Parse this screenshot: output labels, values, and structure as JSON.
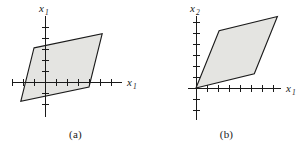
{
  "figure": {
    "background_color": "#ffffff",
    "axis_color": "#1a1a1a",
    "shape_fill_color": "#e4e4e1",
    "shape_stroke_color": "#1a1a1a"
  },
  "panels": [
    {
      "id": "a",
      "caption": "(a)",
      "y_axis_label": "x",
      "y_axis_subscript": "1",
      "x_axis_label": "x",
      "x_axis_subscript": "1",
      "origin_px": {
        "x": 45,
        "y": 82
      },
      "unit_px": 11,
      "x_axis_extent_px": {
        "left": -33,
        "right": 77
      },
      "y_axis_extent_px": {
        "up": -66,
        "down": 35
      },
      "x_ticks_units": [
        -3,
        -2,
        -1,
        1,
        2,
        3,
        4,
        5,
        6
      ],
      "y_ticks_units": [
        -2,
        -1,
        1,
        2,
        3,
        4,
        5
      ],
      "parallelogram_units": [
        {
          "x": -1.0,
          "y": 3.1
        },
        {
          "x": 5.2,
          "y": 4.4
        },
        {
          "x": 4.0,
          "y": -0.45
        },
        {
          "x": -2.2,
          "y": -1.75
        }
      ]
    },
    {
      "id": "b",
      "caption": "(b)",
      "y_axis_label": "x",
      "y_axis_subscript": "2",
      "x_axis_label": "x",
      "x_axis_subscript": "1",
      "origin_px": {
        "x": 45,
        "y": 88
      },
      "unit_px": 11,
      "x_axis_extent_px": {
        "left": -8,
        "right": 85
      },
      "y_axis_extent_px": {
        "up": -72,
        "down": 32
      },
      "x_ticks_units": [
        1,
        2,
        3,
        4,
        5,
        6,
        7
      ],
      "y_ticks_units": [
        -2,
        -1,
        1,
        2,
        3,
        4,
        5,
        6
      ],
      "parallelogram_units": [
        {
          "x": 0.0,
          "y": 0.0
        },
        {
          "x": 2.1,
          "y": 5.2
        },
        {
          "x": 7.4,
          "y": 6.5
        },
        {
          "x": 5.3,
          "y": 1.3
        }
      ]
    }
  ]
}
